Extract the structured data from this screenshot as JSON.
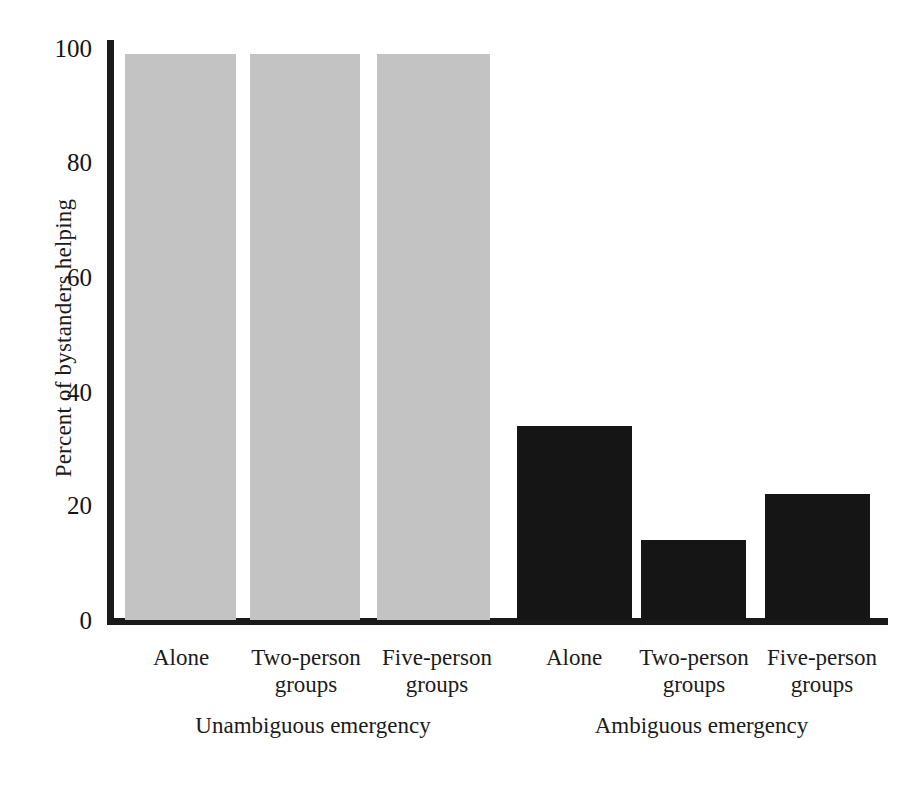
{
  "chart_data": {
    "type": "bar",
    "title": "",
    "subtitle": "",
    "xlabel": "",
    "ylabel": "Percent of bystanders helping",
    "ylim": [
      0,
      100
    ],
    "yticks": [
      0,
      20,
      40,
      60,
      80,
      100
    ],
    "ytick_labels": [
      "0",
      "20",
      "40",
      "60",
      "80",
      "100"
    ],
    "grid": false,
    "legend": "none",
    "categories": [
      "Alone",
      "Two-person groups",
      "Five-person groups"
    ],
    "group_labels": [
      "Unambiguous emergency",
      "Ambiguous emergency"
    ],
    "series": [
      {
        "name": "Unambiguous emergency",
        "color": "#c3c3c3",
        "values": [
          99,
          99,
          99
        ]
      },
      {
        "name": "Ambiguous emergency",
        "color": "#151515",
        "values": [
          34,
          14,
          22
        ]
      }
    ],
    "bars": [
      {
        "id": "bar-unambiguous-alone",
        "group": "Unambiguous emergency",
        "category": "Alone",
        "value": 99,
        "color": "#c3c3c3"
      },
      {
        "id": "bar-unambiguous-two-person",
        "group": "Unambiguous emergency",
        "category": "Two-person groups",
        "value": 99,
        "color": "#c3c3c3"
      },
      {
        "id": "bar-unambiguous-five-person",
        "group": "Unambiguous emergency",
        "category": "Five-person groups",
        "value": 99,
        "color": "#c3c3c3"
      },
      {
        "id": "bar-ambiguous-alone",
        "group": "Ambiguous emergency",
        "category": "Alone",
        "value": 34,
        "color": "#151515"
      },
      {
        "id": "bar-ambiguous-two-person",
        "group": "Ambiguous emergency",
        "category": "Two-person groups",
        "value": 14,
        "color": "#151515"
      },
      {
        "id": "bar-ambiguous-five-person",
        "group": "Ambiguous emergency",
        "category": "Five-person groups",
        "value": 22,
        "color": "#151515"
      }
    ]
  },
  "axis": {
    "y_title": "Percent of bystanders helping",
    "y_labels": {
      "t100": "100",
      "t80": "80",
      "t60": "60",
      "t40": "40",
      "t20": "20",
      "t0": "0"
    }
  },
  "x_labels": [
    {
      "line1": "Alone",
      "line2": ""
    },
    {
      "line1": "Two-person",
      "line2": "groups"
    },
    {
      "line1": "Five-person",
      "line2": "groups"
    },
    {
      "line1": "Alone",
      "line2": ""
    },
    {
      "line1": "Two-person",
      "line2": "groups"
    },
    {
      "line1": "Five-person",
      "line2": "groups"
    }
  ],
  "group_labels": [
    {
      "text": "Unambiguous emergency"
    },
    {
      "text": "Ambiguous emergency"
    }
  ],
  "caption_remnant": "",
  "colors": {
    "light_bar": "#c3c3c3",
    "dark_bar": "#151515",
    "axis": "#1a1a1a",
    "text": "#1b1b1b",
    "background": "#ffffff"
  }
}
